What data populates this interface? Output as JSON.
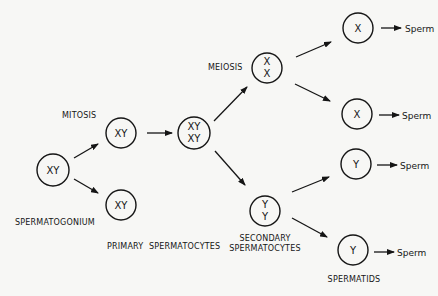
{
  "diagram": {
    "colors": {
      "background": "#f7f7f5",
      "ink": "#151515"
    },
    "labels": {
      "mitosis": "MITOSIS",
      "meiosis": "MEIOSIS",
      "spermatogonium": "SPERMATOGONIUM",
      "primary": "PRIMARY  SPERMATOCYTES",
      "secondary_line1": "SECONDARY",
      "secondary_line2": "SPERMATOCYTES",
      "spermatids": "SPERMATIDS"
    },
    "cells": {
      "spermatogonium": [
        "XY"
      ],
      "primary_top": [
        "XY"
      ],
      "primary_bottom": [
        "XY"
      ],
      "primary_replicated": [
        "XY",
        "XY"
      ],
      "secondary_x": [
        "X",
        "X"
      ],
      "secondary_y": [
        "Y",
        "Y"
      ],
      "spermatid_1": [
        "X"
      ],
      "spermatid_2": [
        "X"
      ],
      "spermatid_3": [
        "Y"
      ],
      "spermatid_4": [
        "Y"
      ]
    },
    "outputs": [
      "Sperm",
      "Sperm",
      "Sperm",
      "Sperm"
    ]
  }
}
